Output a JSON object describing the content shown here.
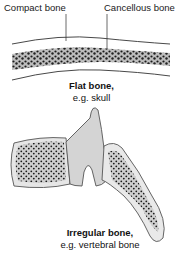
{
  "labels": {
    "compact_bone": "Compact bone",
    "cancellous_bone": "Cancellous bone"
  },
  "flat_bone": {
    "title": "Flat bone,",
    "example": "e.g. skull"
  },
  "irregular_bone": {
    "title": "Irregular bone,",
    "example": "e.g. vertebral bone"
  },
  "colors": {
    "outline": "#555555",
    "fill_light": "#d4d4d4",
    "spongy_dots": "#1a1a1a",
    "background": "#ffffff"
  }
}
